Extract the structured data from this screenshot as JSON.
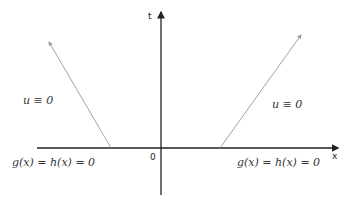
{
  "diagram": {
    "axes": {
      "x_label": "x",
      "t_label": "t",
      "origin_label": "0"
    },
    "regions": {
      "left": {
        "u_label": "u ≡ 0",
        "boundary_label": "g(x) = h(x) = 0"
      },
      "right": {
        "u_label": "u ≡ 0",
        "boundary_label": "g(x) = h(x) = 0"
      }
    },
    "colors": {
      "axis": "#222222",
      "characteristic": "#999999",
      "text": "#333333"
    }
  }
}
